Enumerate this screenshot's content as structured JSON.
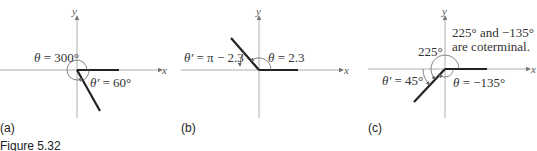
{
  "figure": {
    "caption": "Figure 5.32",
    "panels": [
      {
        "id": "a",
        "label": "(a)",
        "axis_x": "x",
        "axis_y": "y",
        "theta_symbol": "θ",
        "theta_value": " = 300°",
        "ref_symbol": "θ′",
        "ref_value": " = 60°"
      },
      {
        "id": "b",
        "label": "(b)",
        "axis_x": "x",
        "axis_y": "y",
        "theta_symbol": "θ",
        "theta_value": " = 2.3",
        "ref_symbol": "θ′",
        "ref_value": " = π − 2.3"
      },
      {
        "id": "c",
        "label": "(c)",
        "axis_x": "x",
        "axis_y": "y",
        "angle_225": "225°",
        "note_line1": "225° and −135°",
        "note_line2": "are coterminal.",
        "theta_symbol": "θ",
        "theta_value": " = −135°",
        "ref_symbol": "θ′",
        "ref_value": " = 45°"
      }
    ]
  }
}
